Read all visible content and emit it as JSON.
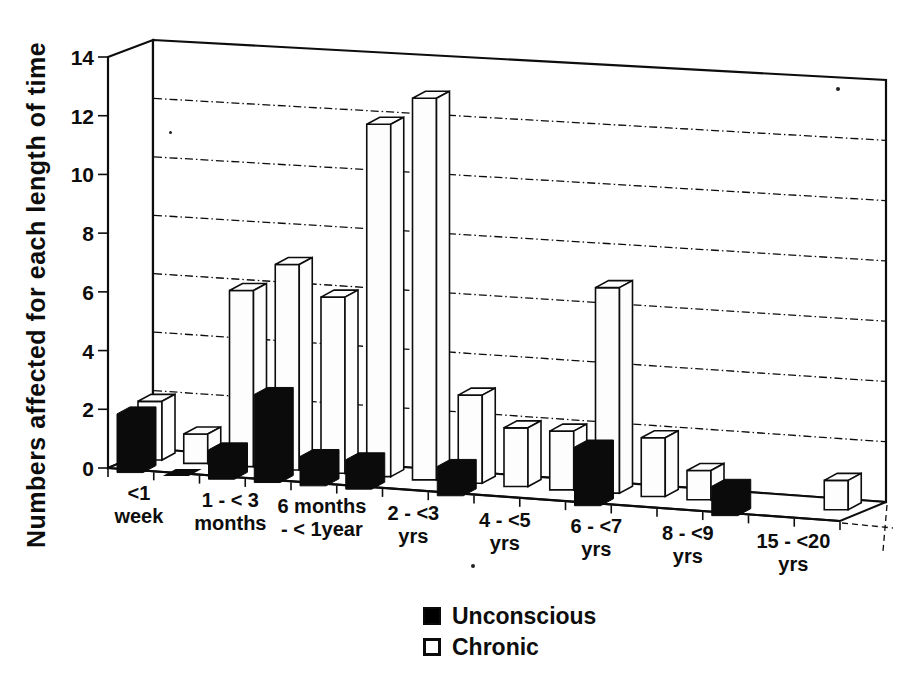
{
  "figure": {
    "background": "#ffffff",
    "style": "scanned 3d column chart, monochrome"
  },
  "y_axis": {
    "ticks": [
      0,
      2,
      4,
      6,
      8,
      10,
      12,
      14
    ],
    "min": 0,
    "max": 14
  },
  "chart_data": {
    "type": "bar",
    "projection": "3d-column",
    "title": "",
    "xlabel": "",
    "ylabel": "Numbers affected for each length of time",
    "ylim": [
      0,
      14
    ],
    "ytick_interval": 2,
    "gridlines": "dash-dot-horizontal",
    "legend_position": "bottom-center",
    "note": "labels shown for every other category slot; null = no bar drawn, 0 = flat zero tile",
    "categories": [
      {
        "label": "<1 week",
        "label_lines": [
          "<1",
          "week"
        ]
      },
      {
        "label": "",
        "label_lines": []
      },
      {
        "label": "1 - < 3 months",
        "label_lines": [
          "1 - < 3",
          "months"
        ]
      },
      {
        "label": "",
        "label_lines": []
      },
      {
        "label": "6 months - < 1year",
        "label_lines": [
          "6 months",
          "- < 1year"
        ]
      },
      {
        "label": "",
        "label_lines": []
      },
      {
        "label": "2 - <3 yrs",
        "label_lines": [
          "2 - <3",
          "yrs"
        ]
      },
      {
        "label": "",
        "label_lines": []
      },
      {
        "label": "4 - <5 yrs",
        "label_lines": [
          "4 - <5",
          "yrs"
        ]
      },
      {
        "label": "",
        "label_lines": []
      },
      {
        "label": "6 - <7 yrs",
        "label_lines": [
          "6 - <7",
          "yrs"
        ]
      },
      {
        "label": "",
        "label_lines": []
      },
      {
        "label": "8 - <9 yrs",
        "label_lines": [
          "8 - <9",
          "yrs"
        ]
      },
      {
        "label": "",
        "label_lines": []
      },
      {
        "label": "15 - <20 yrs",
        "label_lines": [
          "15 - <20",
          "yrs"
        ]
      },
      {
        "label": "",
        "label_lines": []
      }
    ],
    "series": [
      {
        "name": "Unconscious",
        "color": "#000000",
        "values": [
          2,
          0,
          1,
          3,
          1,
          1,
          null,
          1,
          null,
          null,
          2,
          null,
          null,
          1,
          null,
          null
        ]
      },
      {
        "name": "Chronic",
        "color": "#ffffff",
        "values": [
          2,
          1,
          6,
          7,
          6,
          12,
          13,
          3,
          2,
          2,
          7,
          2,
          1,
          null,
          null,
          1
        ]
      }
    ]
  }
}
